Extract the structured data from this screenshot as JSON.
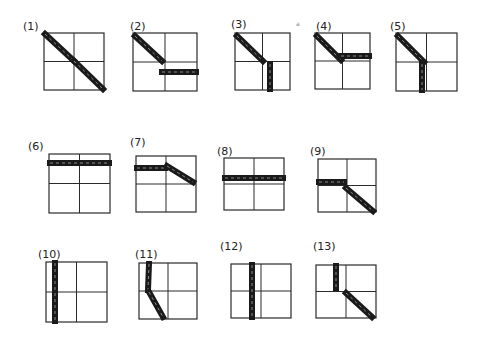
{
  "figure": {
    "width": 485,
    "height": 343,
    "ink_color": "#1a1a1a",
    "stroke_width": 6,
    "stray_mark": {
      "text": "a",
      "x": 296,
      "y": 26
    },
    "panels": [
      {
        "label": "(1)",
        "lx": 23,
        "ly": 30,
        "box": [
          44,
          33,
          60,
          57
        ],
        "strokes": [
          [
            [
              45,
              34
            ],
            [
              74,
              61
            ]
          ],
          [
            [
              74,
              61
            ],
            [
              103,
              89
            ]
          ]
        ]
      },
      {
        "label": "(2)",
        "lx": 130,
        "ly": 30,
        "box": [
          133,
          33,
          64,
          58
        ],
        "strokes": [
          [
            [
              135,
              36
            ],
            [
              162,
              61
            ]
          ],
          [
            [
              162,
              72
            ],
            [
              196,
              72
            ]
          ]
        ]
      },
      {
        "label": "(3)",
        "lx": 231,
        "ly": 28,
        "box": [
          235,
          33,
          55,
          57
        ],
        "strokes": [
          [
            [
              237,
              36
            ],
            [
              263,
              61
            ]
          ],
          [
            [
              270,
              64
            ],
            [
              270,
              89
            ]
          ]
        ]
      },
      {
        "label": "(4)",
        "lx": 316,
        "ly": 30,
        "box": [
          315,
          33,
          55,
          56
        ],
        "strokes": [
          [
            [
              317,
              36
            ],
            [
              341,
              60
            ]
          ],
          [
            [
              341,
              56
            ],
            [
              369,
              56
            ]
          ]
        ]
      },
      {
        "label": "(5)",
        "lx": 390,
        "ly": 30,
        "box": [
          396,
          33,
          61,
          58
        ],
        "strokes": [
          [
            [
              398,
              36
            ],
            [
              424,
              62
            ]
          ],
          [
            [
              422,
              64
            ],
            [
              422,
              90
            ]
          ]
        ]
      },
      {
        "label": "(6)",
        "lx": 28,
        "ly": 150,
        "box": [
          49,
          154,
          61,
          59
        ],
        "strokes": [
          [
            [
              50,
              163
            ],
            [
              109,
              163
            ]
          ]
        ]
      },
      {
        "label": "(7)",
        "lx": 130,
        "ly": 146,
        "box": [
          136,
          156,
          60,
          56
        ],
        "strokes": [
          [
            [
              137,
              168
            ],
            [
              165,
              168
            ]
          ],
          [
            [
              167,
              166
            ],
            [
              193,
              182
            ]
          ]
        ]
      },
      {
        "label": "(8)",
        "lx": 217,
        "ly": 155,
        "box": [
          224,
          158,
          60,
          52
        ],
        "strokes": [
          [
            [
              225,
              178
            ],
            [
              283,
              178
            ]
          ]
        ]
      },
      {
        "label": "(9)",
        "lx": 310,
        "ly": 155,
        "box": [
          318,
          159,
          58,
          53
        ],
        "strokes": [
          [
            [
              319,
              182
            ],
            [
              344,
              182
            ]
          ],
          [
            [
              346,
              188
            ],
            [
              373,
              211
            ]
          ]
        ]
      },
      {
        "label": "(10)",
        "lx": 38,
        "ly": 258,
        "box": [
          46,
          262,
          61,
          60
        ],
        "strokes": [
          [
            [
              55,
              263
            ],
            [
              55,
              321
            ]
          ]
        ]
      },
      {
        "label": "(11)",
        "lx": 135,
        "ly": 258,
        "box": [
          139,
          263,
          58,
          56
        ],
        "strokes": [
          [
            [
              149,
              264
            ],
            [
              148,
              290
            ]
          ],
          [
            [
              149,
              292
            ],
            [
              163,
              317
            ]
          ]
        ]
      },
      {
        "label": "(12)",
        "lx": 220,
        "ly": 250,
        "box": [
          231,
          264,
          60,
          54
        ],
        "strokes": [
          [
            [
              252,
              265
            ],
            [
              252,
              317
            ]
          ]
        ]
      },
      {
        "label": "(13)",
        "lx": 313,
        "ly": 250,
        "box": [
          316,
          265,
          60,
          53
        ],
        "strokes": [
          [
            [
              336,
              266
            ],
            [
              336,
              288
            ]
          ],
          [
            [
              346,
              293
            ],
            [
              372,
              317
            ]
          ]
        ]
      }
    ]
  }
}
